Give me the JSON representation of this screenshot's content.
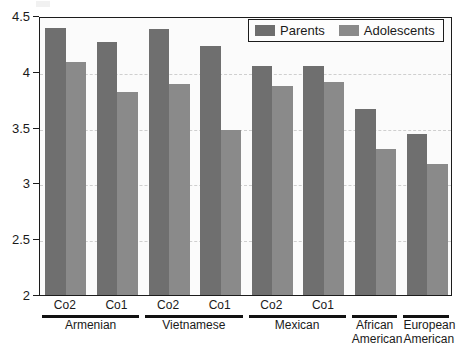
{
  "chart_data": {
    "type": "bar",
    "title": "",
    "xlabel": "",
    "ylabel": "",
    "ylim": [
      2,
      4.5
    ],
    "yticks": [
      "2",
      "2.5",
      "3",
      "3.5",
      "4",
      "4.5"
    ],
    "ytick_values": [
      2,
      2.5,
      3,
      3.5,
      4,
      4.5
    ],
    "grid": true,
    "legend_position": "top-right",
    "legend": [
      "Parents",
      "Adolescents"
    ],
    "categories": [
      "Armenian Co2",
      "Armenian Co1",
      "Vietnamese Co2",
      "Vietnamese Co1",
      "Mexican Co2",
      "Mexican Co1",
      "African American",
      "European American"
    ],
    "cohort_labels": [
      "Co2",
      "Co1",
      "Co2",
      "Co1",
      "Co2",
      "Co1",
      "",
      ""
    ],
    "groups": [
      {
        "name": "Armenian",
        "cohorts": [
          "Co2",
          "Co1"
        ]
      },
      {
        "name": "Vietnamese",
        "cohorts": [
          "Co2",
          "Co1"
        ]
      },
      {
        "name": "Mexican",
        "cohorts": [
          "Co2",
          "Co1"
        ]
      },
      {
        "name": "African American",
        "cohorts": []
      },
      {
        "name": "European American",
        "cohorts": []
      }
    ],
    "series": [
      {
        "name": "Parents",
        "color": "#6f6f6f",
        "values": [
          4.39,
          4.27,
          4.38,
          4.23,
          4.05,
          4.05,
          3.67,
          3.44
        ]
      },
      {
        "name": "Adolescents",
        "color": "#8a8a8a",
        "values": [
          4.09,
          3.82,
          3.89,
          3.48,
          3.87,
          3.91,
          3.31,
          3.17
        ]
      }
    ]
  },
  "colors": {
    "parents": "#6f6f6f",
    "adolescents": "#8a8a8a",
    "axis": "#1c1c1c",
    "grid": "#cfcfcf",
    "plot_background": "#fbfbfb"
  }
}
